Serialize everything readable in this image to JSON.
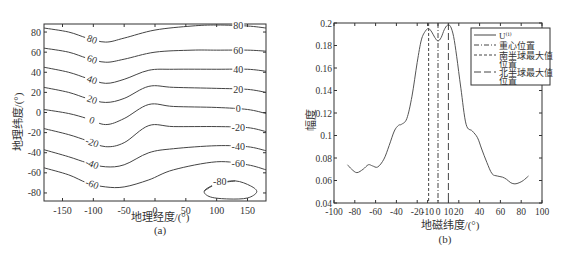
{
  "chart_data": [
    {
      "type": "contour",
      "panel_label": "(a)",
      "title": "",
      "xlabel": "地理经度/(°)",
      "ylabel": "地理纬度/(°)",
      "xlim": [
        -180,
        180
      ],
      "ylim": [
        -88,
        88
      ],
      "xticks": [
        -150,
        -100,
        -50,
        0,
        50,
        100,
        150
      ],
      "yticks": [
        80,
        60,
        40,
        20,
        0,
        -20,
        -40,
        -60,
        -80
      ],
      "grid": false,
      "contour_levels": [
        80,
        60,
        40,
        20,
        0,
        -20,
        -40,
        -60,
        -80
      ],
      "contours": [
        {
          "level": 80,
          "label": "80",
          "points": [
            [
              -180,
              84
            ],
            [
              -140,
              80
            ],
            [
              -110,
              74
            ],
            [
              -80,
              70
            ],
            [
              -50,
              74
            ],
            [
              0,
              82
            ],
            [
              60,
              86
            ],
            [
              100,
              87
            ],
            [
              150,
              86
            ],
            [
              180,
              84
            ]
          ]
        },
        {
          "level": 60,
          "label": "60",
          "points": [
            [
              -180,
              64
            ],
            [
              -140,
              60
            ],
            [
              -110,
              54
            ],
            [
              -80,
              50
            ],
            [
              -50,
              53
            ],
            [
              0,
              60
            ],
            [
              60,
              62
            ],
            [
              100,
              62
            ],
            [
              150,
              62
            ],
            [
              180,
              61
            ]
          ]
        },
        {
          "level": 40,
          "label": "40",
          "points": [
            [
              -180,
              45
            ],
            [
              -140,
              40
            ],
            [
              -110,
              34
            ],
            [
              -80,
              29
            ],
            [
              -50,
              33
            ],
            [
              -10,
              42
            ],
            [
              30,
              43
            ],
            [
              100,
              43
            ],
            [
              150,
              43
            ],
            [
              180,
              41
            ]
          ]
        },
        {
          "level": 20,
          "label": "20",
          "points": [
            [
              -180,
              25
            ],
            [
              -140,
              20
            ],
            [
              -110,
              14
            ],
            [
              -80,
              10
            ],
            [
              -50,
              14
            ],
            [
              -10,
              26
            ],
            [
              30,
              25
            ],
            [
              100,
              24
            ],
            [
              150,
              23
            ],
            [
              180,
              20
            ]
          ]
        },
        {
          "level": 0,
          "label": "0",
          "points": [
            [
              -180,
              3
            ],
            [
              -140,
              -1
            ],
            [
              -110,
              -6
            ],
            [
              -80,
              -12
            ],
            [
              -50,
              -6
            ],
            [
              -10,
              8
            ],
            [
              30,
              6
            ],
            [
              100,
              5
            ],
            [
              150,
              3
            ],
            [
              180,
              -1
            ]
          ]
        },
        {
          "level": -20,
          "label": "-20",
          "points": [
            [
              -180,
              -16
            ],
            [
              -140,
              -22
            ],
            [
              -110,
              -28
            ],
            [
              -80,
              -34
            ],
            [
              -50,
              -30
            ],
            [
              -10,
              -13
            ],
            [
              30,
              -14
            ],
            [
              100,
              -14
            ],
            [
              150,
              -15
            ],
            [
              180,
              -19
            ]
          ]
        },
        {
          "level": -40,
          "label": "-40",
          "points": [
            [
              -180,
              -37
            ],
            [
              -140,
              -44
            ],
            [
              -110,
              -50
            ],
            [
              -80,
              -54
            ],
            [
              -50,
              -52
            ],
            [
              -10,
              -40
            ],
            [
              30,
              -36
            ],
            [
              100,
              -33
            ],
            [
              150,
              -34
            ],
            [
              180,
              -38
            ]
          ]
        },
        {
          "level": -60,
          "label": "-60",
          "points": [
            [
              -180,
              -55
            ],
            [
              -140,
              -62
            ],
            [
              -110,
              -70
            ],
            [
              -80,
              -74
            ],
            [
              -50,
              -74
            ],
            [
              -10,
              -67
            ],
            [
              30,
              -57
            ],
            [
              100,
              -49
            ],
            [
              150,
              -52
            ],
            [
              180,
              -57
            ]
          ]
        },
        {
          "level": -80,
          "label": "-80",
          "closed": true,
          "center": [
            125,
            -79
          ],
          "points": [
            [
              80,
              -78
            ],
            [
              100,
              -71
            ],
            [
              130,
              -68
            ],
            [
              155,
              -73
            ],
            [
              165,
              -79
            ],
            [
              150,
              -85
            ],
            [
              120,
              -86
            ],
            [
              90,
              -84
            ]
          ]
        }
      ]
    },
    {
      "type": "line",
      "panel_label": "(b)",
      "title": "",
      "xlabel": "地磁纬度/(°)",
      "ylabel": "幅度",
      "xlim": [
        -100,
        100
      ],
      "ylim": [
        0.04,
        0.2
      ],
      "xtick_labels": [
        "-100",
        "-80",
        "-60",
        "-40",
        "-20",
        "-10",
        "0",
        "10",
        "20",
        "40",
        "60",
        "80",
        "100"
      ],
      "xticks": [
        -100,
        -80,
        -60,
        -40,
        -20,
        -10,
        0,
        10,
        20,
        40,
        60,
        80,
        100
      ],
      "yticks": [
        0.04,
        0.06,
        0.08,
        0.1,
        0.12,
        0.14,
        0.16,
        0.18,
        0.2
      ],
      "ytick_labels": [
        "0.04",
        "0.06",
        "0.08",
        "0.1",
        "0.12",
        "0.14",
        "0.16",
        "0.18",
        "0.2"
      ],
      "grid": false,
      "legend_position": "upper right",
      "series": [
        {
          "name": "U⁽ⁱ⁾",
          "style": "solid",
          "x": [
            -87,
            -83,
            -78,
            -72,
            -67,
            -63,
            -58,
            -52,
            -47,
            -42,
            -38,
            -35,
            -30,
            -25,
            -20,
            -16,
            -12,
            -9,
            -6,
            -3,
            0,
            3,
            6,
            9,
            12,
            15,
            18,
            22,
            27,
            33,
            38,
            42,
            47,
            52,
            57,
            62,
            66,
            70,
            74,
            78,
            82,
            87
          ],
          "y": [
            0.074,
            0.07,
            0.067,
            0.07,
            0.074,
            0.073,
            0.072,
            0.079,
            0.091,
            0.104,
            0.109,
            0.11,
            0.115,
            0.135,
            0.165,
            0.185,
            0.193,
            0.195,
            0.192,
            0.187,
            0.184,
            0.187,
            0.194,
            0.198,
            0.197,
            0.188,
            0.17,
            0.142,
            0.11,
            0.104,
            0.098,
            0.088,
            0.076,
            0.066,
            0.064,
            0.063,
            0.061,
            0.058,
            0.057,
            0.058,
            0.06,
            0.064
          ]
        },
        {
          "name": "重心位置",
          "style": "dash-dot",
          "vline_x": 0
        },
        {
          "name": "南半球最大值位置",
          "style": "short-dash",
          "vline_x": -9
        },
        {
          "name": "北半球最大值位置",
          "style": "long-dash",
          "vline_x": 10
        }
      ]
    }
  ],
  "panel_a": {
    "caption": "(a)",
    "xlabel": "地理经度/(°)",
    "ylabel": "地理纬度/(°)"
  },
  "panel_b": {
    "caption": "(b)",
    "xlabel": "地磁纬度/(°)",
    "ylabel": "幅度",
    "legend": [
      {
        "label": "U⁽ⁱ⁾",
        "style": "solid"
      },
      {
        "label": "重心位置",
        "style": "dash-dot"
      },
      {
        "label": "南半球最大值",
        "label_line2": "位置",
        "style": "short-dash"
      },
      {
        "label": "北半球最大值",
        "label_line2": "位置",
        "style": "long-dash"
      }
    ]
  },
  "colors": {
    "line": "#444444",
    "axis": "#333333",
    "text": "#333333",
    "background": "#ffffff"
  }
}
